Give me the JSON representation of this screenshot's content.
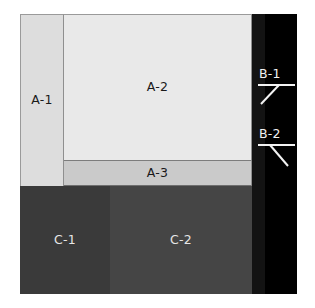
{
  "diagram": {
    "canvas": {
      "width": 315,
      "height": 308,
      "background": "#ffffff"
    },
    "regions": [
      {
        "id": "A-1",
        "label": "A-1",
        "group": "A",
        "color": "#dddddd",
        "label_color": "#1a1a1a",
        "position": {
          "x": 20,
          "y": 14,
          "width": 44,
          "height": 172
        }
      },
      {
        "id": "A-2",
        "label": "A-2",
        "group": "A",
        "color": "#e9e9e9",
        "label_color": "#1a1a1a",
        "position": {
          "x": 64,
          "y": 14,
          "width": 188,
          "height": 147
        }
      },
      {
        "id": "A-3",
        "label": "A-3",
        "group": "A",
        "color": "#cacaca",
        "label_color": "#1a1a1a",
        "position": {
          "x": 64,
          "y": 161,
          "width": 188,
          "height": 25
        }
      },
      {
        "id": "C-1",
        "label": "C-1",
        "group": "C",
        "color": "#3a3a3a",
        "label_color": "#e6e6e6",
        "position": {
          "x": 20,
          "y": 186,
          "width": 90,
          "height": 108
        }
      },
      {
        "id": "C-2",
        "label": "C-2",
        "group": "C",
        "color": "#454545",
        "label_color": "#e6e6e6",
        "position": {
          "x": 110,
          "y": 186,
          "width": 142,
          "height": 108
        }
      },
      {
        "id": "B-1",
        "label": "B-1",
        "group": "B",
        "color": "#131313",
        "label_color": "#f2f2f2",
        "position": {
          "x": 252,
          "y": 14,
          "width": 13,
          "height": 280
        }
      },
      {
        "id": "B-2",
        "label": "B-2",
        "group": "B",
        "color": "#000000",
        "label_color": "#f2f2f2",
        "position": {
          "x": 265,
          "y": 14,
          "width": 32,
          "height": 280
        }
      }
    ],
    "callouts": [
      {
        "id": "callout-b1",
        "label": "B-1",
        "underline": true,
        "leader_direction": "down-left",
        "target_region": "B-1"
      },
      {
        "id": "callout-b2",
        "label": "B-2",
        "underline": true,
        "leader_direction": "down-right",
        "target_region": "B-2"
      }
    ]
  }
}
